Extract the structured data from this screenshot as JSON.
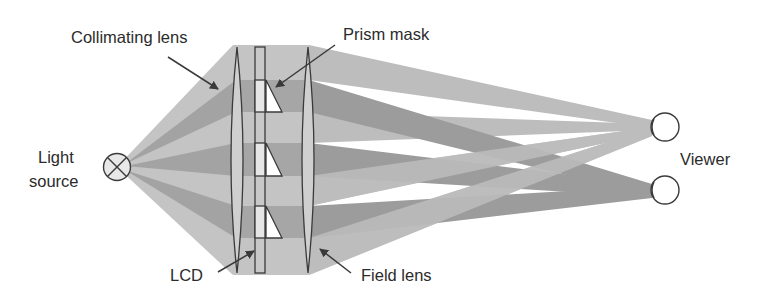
{
  "diagram": {
    "type": "optical-schematic",
    "labels": {
      "collimating_lens": "Collimating lens",
      "prism_mask": "Prism mask",
      "light_source_line1": "Light",
      "light_source_line2": "source",
      "viewer": "Viewer",
      "lcd": "LCD",
      "field_lens": "Field lens"
    },
    "colors": {
      "background": "#ffffff",
      "beam_light": "#bdbdbd",
      "beam_dark": "#9a9a9a",
      "outline": "#3a3a3a",
      "lcd_cell": "#d9d9d9",
      "lens_fill": "#cfcfcf",
      "text": "#2b2b2b"
    },
    "components": [
      {
        "id": "light-source",
        "label": "Light source",
        "glyph": "circle-with-x"
      },
      {
        "id": "collimating-lens",
        "label": "Collimating lens"
      },
      {
        "id": "lcd",
        "label": "LCD"
      },
      {
        "id": "prism-mask",
        "label": "Prism mask",
        "prism_count": 3
      },
      {
        "id": "field-lens",
        "label": "Field lens"
      },
      {
        "id": "viewer",
        "label": "Viewer",
        "eyes": 2
      }
    ]
  }
}
